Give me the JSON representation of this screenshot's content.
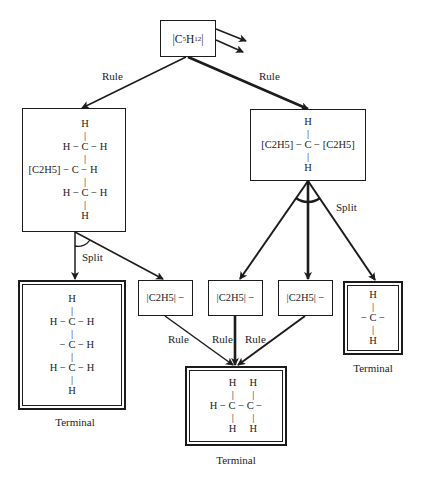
{
  "diagram": {
    "root": {
      "formula": "|C5H12|",
      "text_parts": [
        "|C",
        "5",
        "H",
        "12",
        "|"
      ]
    },
    "edges": {
      "root_to_left": "Rule",
      "root_to_right": "Rule",
      "left_split": "Split",
      "right_split": "Split",
      "middle_rule_1": "Rule",
      "middle_rule_2": "Rule",
      "middle_rule_3": "Rule"
    },
    "left_node": {
      "rows": [
        "H",
        "|",
        "H − C − H",
        "|",
        "[C2H5] − C − H",
        "|",
        "H − C − H",
        "|",
        "H"
      ]
    },
    "right_node": {
      "rows": [
        "H",
        "|",
        "[C2H5] − C − [C2H5]",
        "|",
        "H"
      ]
    },
    "fragments": [
      {
        "label": "|C2H5| −"
      },
      {
        "label": "|C2H5| −"
      },
      {
        "label": "|C2H5| −"
      }
    ],
    "terminals": {
      "left": {
        "caption": "Terminal",
        "rows": [
          "H",
          "|",
          "H − C − H",
          "|",
          "− C − H",
          "|",
          "H − C − H",
          "|",
          "H"
        ]
      },
      "right": {
        "caption": "Terminal",
        "rows": [
          "H",
          "|",
          "− C −",
          "|",
          "H"
        ]
      },
      "bottom": {
        "caption": "Terminal",
        "rows": [
          "H     H",
          "|       |",
          "H − C − C −",
          "|       |",
          "H     H"
        ]
      }
    }
  }
}
